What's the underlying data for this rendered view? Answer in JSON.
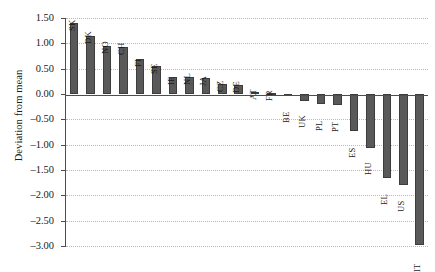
{
  "chart_data": {
    "type": "bar",
    "title": "",
    "xlabel": "",
    "ylabel": "Deviation from mean",
    "ylim": [
      -3.0,
      1.5
    ],
    "ytick_labels": [
      "1.50",
      "1.00",
      "0.50",
      "0.00",
      "–0.50",
      "–1.00",
      "–1.50",
      "–2.00",
      "–2.50",
      "–3.00"
    ],
    "ytick_values": [
      1.5,
      1.0,
      0.5,
      0.0,
      -0.5,
      -1.0,
      -1.5,
      -2.0,
      -2.5,
      -3.0
    ],
    "grid": "horizontal-dotted",
    "legend": "none",
    "bar_color": "#595959",
    "categories": [
      "SK",
      "DK",
      "NO",
      "CH",
      "FI",
      "SE",
      "IE",
      "NL",
      "JA",
      "CZ",
      "DE",
      "AT",
      "FR",
      "BE",
      "UK",
      "PL",
      "PT",
      "ES",
      "HU",
      "EL",
      "US",
      "IT"
    ],
    "values": [
      1.4,
      1.15,
      0.94,
      0.92,
      0.7,
      0.55,
      0.33,
      0.33,
      0.32,
      0.2,
      0.18,
      0.04,
      0.01,
      -0.03,
      -0.14,
      -0.2,
      -0.22,
      -0.73,
      -1.06,
      -1.65,
      -1.79,
      -2.98
    ]
  }
}
